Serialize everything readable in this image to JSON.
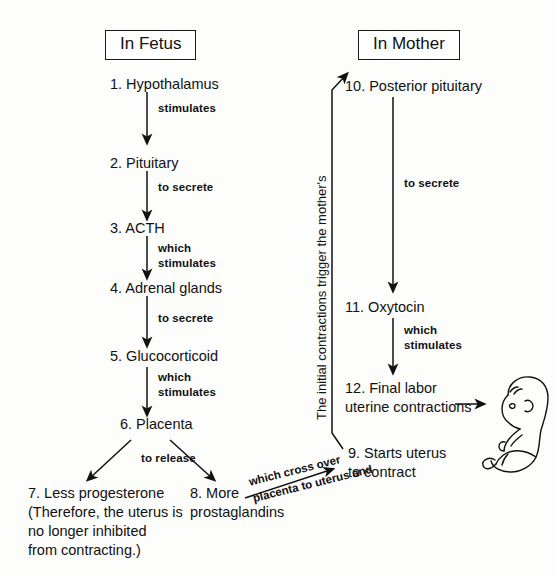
{
  "diagram": {
    "title_boxes": [
      {
        "id": "in-fetus",
        "label": "In Fetus"
      },
      {
        "id": "in-mother",
        "label": "In Mother"
      }
    ],
    "nodes": [
      {
        "id": "node-1",
        "label": "1. Hypothalamus"
      },
      {
        "id": "node-2",
        "label": "2. Pituitary"
      },
      {
        "id": "node-3",
        "label": "3. ACTH"
      },
      {
        "id": "node-4",
        "label": "4. Adrenal glands"
      },
      {
        "id": "node-5",
        "label": "5. Glucocorticoid"
      },
      {
        "id": "node-6",
        "label": "6. Placenta"
      },
      {
        "id": "node-7-line-1",
        "label": "7. Less progesterone"
      },
      {
        "id": "node-7-line-2",
        "label": "(Therefore, the uterus is"
      },
      {
        "id": "node-7-line-3",
        "label": "no longer inhibited"
      },
      {
        "id": "node-7-line-4",
        "label": "from contracting.)"
      },
      {
        "id": "node-8-line-1",
        "label": "8. More"
      },
      {
        "id": "node-8-line-2",
        "label": "prostaglandins"
      },
      {
        "id": "node-9-line-1",
        "label": "9. Starts uterus"
      },
      {
        "id": "node-9-line-2",
        "label": "to contract"
      },
      {
        "id": "node-10",
        "label": "10. Posterior pituitary"
      },
      {
        "id": "node-11",
        "label": "11. Oxytocin"
      },
      {
        "id": "node-12-line-1",
        "label": "12. Final labor"
      },
      {
        "id": "node-12-line-2",
        "label": "uterine contractions"
      }
    ],
    "edge_labels": [
      {
        "id": "edge-1-2",
        "label": "stimulates"
      },
      {
        "id": "edge-2-3",
        "label": "to secrete"
      },
      {
        "id": "edge-3-4-line-1",
        "label": "which"
      },
      {
        "id": "edge-3-4-line-2",
        "label": "stimulates"
      },
      {
        "id": "edge-4-5",
        "label": "to secrete"
      },
      {
        "id": "edge-5-6-line-1",
        "label": "which"
      },
      {
        "id": "edge-5-6-line-2",
        "label": "stimulates"
      },
      {
        "id": "edge-6-split",
        "label": "to release"
      },
      {
        "id": "edge-10-11",
        "label": "to secrete"
      },
      {
        "id": "edge-11-12-line-1",
        "label": "which"
      },
      {
        "id": "edge-11-12-line-2",
        "label": "stimulates"
      }
    ],
    "rotated_labels": [
      {
        "id": "edge-9-10-vertical",
        "label": "The initial contractions trigger the mother's"
      }
    ],
    "diagonal_labels": [
      {
        "id": "edge-8-9-line-1",
        "label": "which cross over"
      },
      {
        "id": "edge-8-9-line-2",
        "label": "placenta to uterus and"
      }
    ],
    "illustration": {
      "id": "fetus-illustration",
      "label": "fetus-baby-figure"
    },
    "colors": {
      "ink": "#111111",
      "background": "#fdfdfc",
      "box_border": "#1a1a1a"
    }
  }
}
